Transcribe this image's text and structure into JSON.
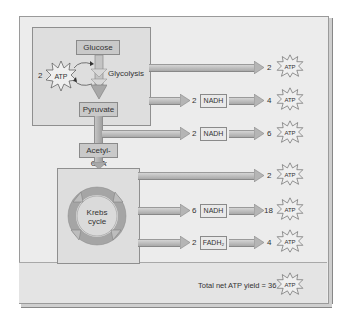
{
  "diagram": {
    "glycolysis": {
      "glucose_label": "Glucose",
      "process_label": "Glycolysis",
      "pyruvate_label": "Pyruvate",
      "invested_atp_count": "2",
      "atp_label": "ATP"
    },
    "acetyl_coa_label": "Acetyl-CoA",
    "krebs": {
      "label_line1": "Krebs",
      "label_line2": "cycle"
    },
    "rows": [
      {
        "carrier_count": "",
        "carrier": "",
        "atp_count": "2",
        "atp_label": "ATP"
      },
      {
        "carrier_count": "2",
        "carrier": "NADH",
        "atp_count": "4",
        "atp_label": "ATP"
      },
      {
        "carrier_count": "2",
        "carrier": "NADH",
        "atp_count": "6",
        "atp_label": "ATP"
      },
      {
        "carrier_count": "",
        "carrier": "",
        "atp_count": "2",
        "atp_label": "ATP"
      },
      {
        "carrier_count": "6",
        "carrier": "NADH",
        "atp_count": "18",
        "atp_label": "ATP"
      },
      {
        "carrier_count": "2",
        "carrier": "FADH₂",
        "atp_count": "4",
        "atp_label": "ATP"
      }
    ],
    "total": {
      "label": "Total net ATP yield = 36",
      "atp_label": "ATP"
    },
    "colors": {
      "frame_bg": "#ececec",
      "inner_bg": "#dedede",
      "label_box": "#c9c9c9",
      "arrow": "#b0b0b0",
      "stroke": "#8a8a8a"
    }
  }
}
